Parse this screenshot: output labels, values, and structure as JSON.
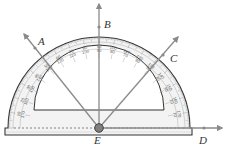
{
  "diagram": {
    "type": "protractor-angle-measurement",
    "center_label": "E",
    "rays": [
      {
        "label": "A",
        "angle_deg": 130
      },
      {
        "label": "B",
        "angle_deg": 90
      },
      {
        "label": "C",
        "angle_deg": 45
      },
      {
        "label": "D",
        "angle_deg": 0
      }
    ],
    "protractor": {
      "outer_scale": [
        0,
        10,
        20,
        30,
        40,
        50,
        60,
        70,
        80,
        90,
        100,
        110,
        120,
        130,
        140,
        150,
        160,
        170,
        180
      ],
      "inner_scale": [
        180,
        170,
        160,
        150,
        140,
        130,
        120,
        110,
        100,
        90,
        80,
        70,
        60,
        50,
        40,
        30,
        20,
        10,
        0
      ],
      "top_label": "90"
    },
    "colors": {
      "ray": "#8a8a8a",
      "outline": "#333333",
      "fill": "#f2f2f2",
      "vertex": "#7a7a7a"
    }
  }
}
